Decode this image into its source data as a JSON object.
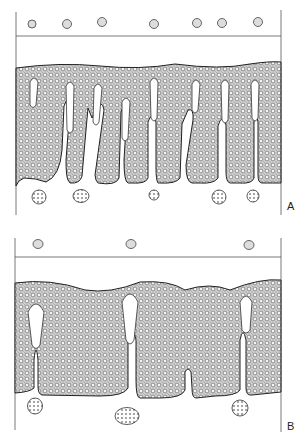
{
  "figure": {
    "panels": [
      {
        "label": "A",
        "surface_cells": 7,
        "invaginations": 8,
        "deep_vessels": 5
      },
      {
        "label": "B",
        "surface_cells": 3,
        "invaginations": 3,
        "deep_vessels": 3
      }
    ]
  },
  "colors": {
    "line": "#333333",
    "tissue_fill": "#d9d9d9",
    "background": "#ffffff"
  }
}
